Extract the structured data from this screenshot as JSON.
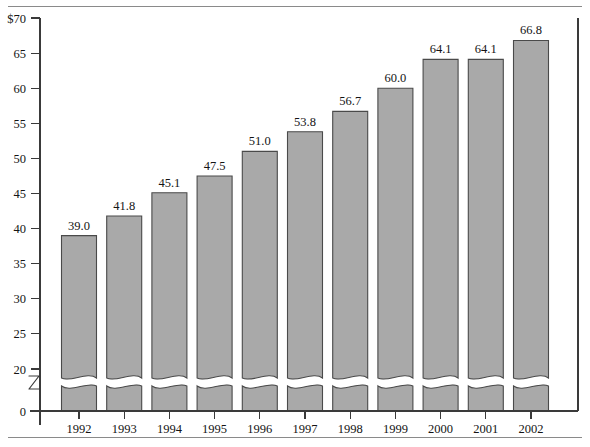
{
  "chart_data": {
    "type": "bar",
    "title": "",
    "subtitle": "",
    "xlabel": "",
    "ylabel": "",
    "categories": [
      "1992",
      "1993",
      "1994",
      "1995",
      "1996",
      "1997",
      "1998",
      "1999",
      "2000",
      "2001",
      "2002"
    ],
    "values": [
      39.0,
      41.8,
      45.1,
      47.5,
      51.0,
      53.8,
      56.7,
      60.0,
      64.1,
      64.1,
      66.8
    ],
    "data_labels": [
      "39.0",
      "41.8",
      "45.1",
      "47.5",
      "51.0",
      "53.8",
      "56.7",
      "60.0",
      "64.1",
      "64.1",
      "66.8"
    ],
    "ylim": [
      0,
      70
    ],
    "y_ticks": [
      0,
      20,
      25,
      30,
      35,
      40,
      45,
      50,
      55,
      60,
      65,
      70
    ],
    "y_tick_labels": [
      "0",
      "20",
      "25",
      "30",
      "35",
      "40",
      "45",
      "50",
      "55",
      "60",
      "65",
      "$70"
    ],
    "axis_break": true,
    "axis_break_between": [
      0,
      20
    ],
    "axis_break_symbol": "z-zigzag",
    "grid": false,
    "legend": null,
    "legend_position": "none",
    "currency_prefix": "$",
    "bar_fill_color": "#a9a9a9",
    "bar_edge_color": "#4a4a4a",
    "axis_color": "#3a3a3a",
    "frame_color": "#8a8a8a",
    "background_color": "#ffffff"
  },
  "figure": {
    "top_rule": "",
    "bottom_rule": ""
  }
}
